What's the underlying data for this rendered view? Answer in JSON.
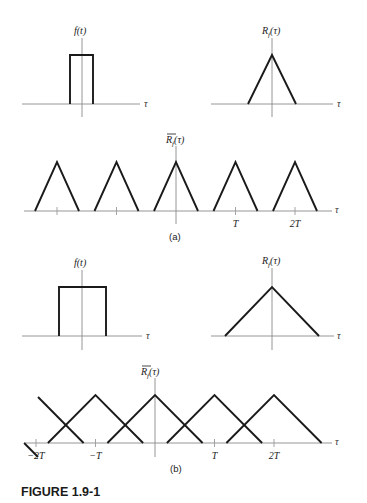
{
  "figure": {
    "caption": "FIGURE 1.9-1",
    "parts": [
      {
        "label": "(a)",
        "pulse": {
          "ylabel": "f(t)",
          "xlabel": "τ",
          "shape": "rectangle",
          "width_fraction_of_T": 0.2
        },
        "autocorr": {
          "ylabel_main": "R",
          "ylabel_sub": "f",
          "ylabel_arg": "(τ)",
          "xlabel": "τ",
          "shape": "triangle",
          "halfwidth_fraction_of_T": 0.37
        },
        "periodic": {
          "ylabel_main": "R",
          "ylabel_sub": "f",
          "ylabel_arg": "(τ)",
          "overbar": true,
          "xlabel": "τ",
          "shape": "triangle train",
          "period_T": 1,
          "halfwidth_fraction_of_T": 0.37,
          "centers_T": [
            -2,
            -1,
            0,
            1,
            2
          ],
          "tick_labels": [
            {
              "at_T": -2,
              "text": ""
            },
            {
              "at_T": -1,
              "text": ""
            },
            {
              "at_T": 1,
              "text": "T"
            },
            {
              "at_T": 2,
              "text": "2T"
            }
          ]
        }
      },
      {
        "label": "(b)",
        "pulse": {
          "ylabel": "f(t)",
          "xlabel": "τ",
          "shape": "rectangle",
          "width_fraction_of_T": 0.8
        },
        "autocorr": {
          "ylabel_main": "R",
          "ylabel_sub": "f",
          "ylabel_arg": "(τ)",
          "xlabel": "τ",
          "shape": "triangle",
          "halfwidth_fraction_of_T": 0.8
        },
        "periodic": {
          "ylabel_main": "R",
          "ylabel_sub": "f",
          "ylabel_arg": "(τ)",
          "overbar": true,
          "xlabel": "τ",
          "shape": "overlapping triangle train",
          "period_T": 1,
          "halfwidth_fraction_of_T": 0.8,
          "centers_T": [
            -3,
            -2,
            -1,
            0,
            1,
            2
          ],
          "tick_labels": [
            {
              "at_T": -2,
              "text": "−2T"
            },
            {
              "at_T": -1,
              "text": "−T"
            },
            {
              "at_T": 1,
              "text": "T"
            },
            {
              "at_T": 2,
              "text": "2T"
            }
          ]
        }
      }
    ]
  }
}
